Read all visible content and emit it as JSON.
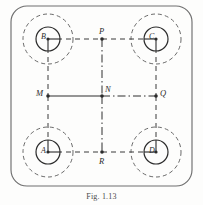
{
  "figure": {
    "caption": "Fig. 1.13",
    "frame": {
      "shape": "rounded-rectangle",
      "style": "solid",
      "color": "#6f6f6f"
    },
    "background_color": "#fdfdfc",
    "line_color": "#3a3a3a",
    "nodes": [
      {
        "id": "B",
        "label": "B",
        "cx": 48,
        "cy": 39,
        "r_inner": 12,
        "r_outer": 25,
        "position": "top-left"
      },
      {
        "id": "C",
        "label": "C",
        "cx": 156,
        "cy": 39,
        "r_inner": 12,
        "r_outer": 25,
        "position": "top-right"
      },
      {
        "id": "A",
        "label": "A",
        "cx": 48,
        "cy": 152,
        "r_inner": 12,
        "r_outer": 25,
        "position": "bottom-left"
      },
      {
        "id": "D",
        "label": "D",
        "cx": 156,
        "cy": 152,
        "r_inner": 12,
        "r_outer": 25,
        "position": "bottom-right"
      }
    ],
    "points": [
      {
        "id": "P",
        "label": "P",
        "x": 102,
        "y": 39,
        "position": "top-middle"
      },
      {
        "id": "M",
        "label": "M",
        "x": 48,
        "y": 96,
        "position": "left-middle"
      },
      {
        "id": "N",
        "label": "N",
        "x": 102,
        "y": 96,
        "position": "center"
      },
      {
        "id": "Q",
        "label": "Q",
        "x": 156,
        "y": 96,
        "position": "right-middle"
      },
      {
        "id": "R",
        "label": "R",
        "x": 102,
        "y": 152,
        "position": "bottom-middle"
      }
    ],
    "edges": [
      {
        "from": "B",
        "to": "P",
        "style": "dashed",
        "orientation": "horizontal"
      },
      {
        "from": "P",
        "to": "C",
        "style": "dashed",
        "orientation": "horizontal"
      },
      {
        "from": "A",
        "to": "R",
        "style": "dashed",
        "orientation": "horizontal"
      },
      {
        "from": "R",
        "to": "D",
        "style": "dashed",
        "orientation": "horizontal"
      },
      {
        "from": "B",
        "to": "M",
        "style": "dashed",
        "orientation": "vertical"
      },
      {
        "from": "M",
        "to": "A",
        "style": "dashed",
        "orientation": "vertical"
      },
      {
        "from": "C",
        "to": "Q",
        "style": "dashed",
        "orientation": "vertical"
      },
      {
        "from": "Q",
        "to": "D",
        "style": "dashed",
        "orientation": "vertical"
      },
      {
        "from": "M",
        "to": "N",
        "style": "solid",
        "orientation": "horizontal"
      },
      {
        "from": "N",
        "to": "Q",
        "style": "dash-dot",
        "orientation": "horizontal"
      },
      {
        "from": "P",
        "to": "N",
        "style": "dash-dot",
        "orientation": "vertical"
      },
      {
        "from": "N",
        "to": "R",
        "style": "dash-dot",
        "orientation": "vertical"
      }
    ]
  }
}
